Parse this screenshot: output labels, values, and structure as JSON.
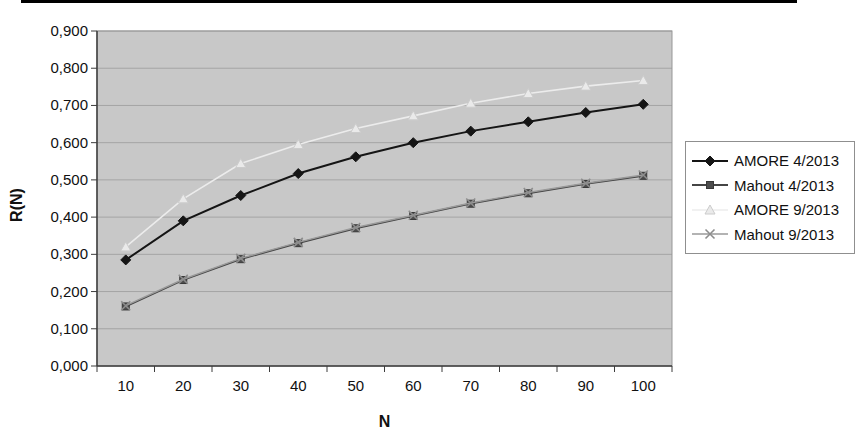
{
  "figure": {
    "background": "#ffffff",
    "top_rule_color": "#000000",
    "text_color": "#111111"
  },
  "chart_data": {
    "type": "line",
    "title": "",
    "xlabel": "N",
    "ylabel": "R(N)",
    "categories": [
      10,
      20,
      30,
      40,
      50,
      60,
      70,
      80,
      90,
      100
    ],
    "x_tick_labels": [
      "10",
      "20",
      "30",
      "40",
      "50",
      "60",
      "70",
      "80",
      "90",
      "100"
    ],
    "ylim": [
      0,
      0.9
    ],
    "y_ticks": [
      0,
      0.1,
      0.2,
      0.3,
      0.4,
      0.5,
      0.6,
      0.7,
      0.8,
      0.9
    ],
    "y_tick_labels": [
      "0,000",
      "0,100",
      "0,200",
      "0,300",
      "0,400",
      "0,500",
      "0,600",
      "0,700",
      "0,800",
      "0,900"
    ],
    "grid": true,
    "legend_position": "right",
    "plot_background": "#c8c8c8",
    "gridline_color": "#a4a4a4",
    "axis_color": "#3c3c3c",
    "plot_border_color": "#979797",
    "series": [
      {
        "name": "AMORE 4/2013",
        "marker": "diamond",
        "color": "#151515",
        "marker_color": "#151515",
        "marker_edge": "#151515",
        "line_width": 2,
        "values": [
          0.285,
          0.39,
          0.458,
          0.517,
          0.562,
          0.6,
          0.631,
          0.656,
          0.681,
          0.703
        ]
      },
      {
        "name": "Mahout 4/2013",
        "marker": "square",
        "color": "#454545",
        "marker_color": "#4d4d4d",
        "marker_edge": "#383838",
        "line_width": 1.8,
        "values": [
          0.16,
          0.231,
          0.287,
          0.33,
          0.37,
          0.403,
          0.436,
          0.464,
          0.489,
          0.511
        ]
      },
      {
        "name": "AMORE 9/2013",
        "marker": "triangle-up",
        "color": "#ececec",
        "marker_color": "#eaeaea",
        "marker_edge": "#cccccc",
        "line_width": 1.6,
        "values": [
          0.32,
          0.449,
          0.544,
          0.595,
          0.638,
          0.672,
          0.706,
          0.732,
          0.752,
          0.767
        ]
      },
      {
        "name": "Mahout 9/2013",
        "marker": "x",
        "color": "#9a9a9a",
        "marker_color": "#8d8d8d",
        "marker_edge": "#8d8d8d",
        "line_width": 1.4,
        "values": [
          0.162,
          0.233,
          0.289,
          0.332,
          0.372,
          0.405,
          0.438,
          0.466,
          0.491,
          0.513
        ]
      }
    ]
  }
}
